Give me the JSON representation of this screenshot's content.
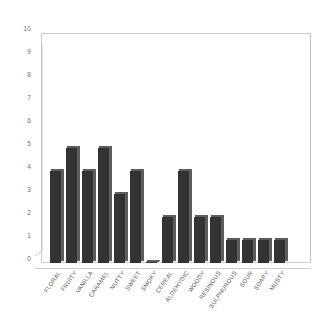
{
  "chart_data": {
    "type": "bar",
    "title": "",
    "subtitle": "",
    "xlabel": "",
    "ylabel": "",
    "ylim": [
      0,
      10
    ],
    "ytick_labels": [
      "0",
      "1",
      "2",
      "3",
      "4",
      "5",
      "6",
      "7",
      "8",
      "9",
      "10"
    ],
    "ytick_values": [
      0,
      1,
      2,
      3,
      4,
      5,
      6,
      7,
      8,
      9,
      10
    ],
    "grid": false,
    "legend": null,
    "bar_color": "#333333",
    "bar_side_color": "#5d5d5d",
    "axis_color": "#c9c9c9",
    "background": "#ffffff",
    "categories": [
      "FLORAL",
      "FRUITY",
      "VANILLA",
      "CARAMEL",
      "NUTTY",
      "SWEET",
      "SMOKY",
      "CEREAL",
      "ALDEHYDIC",
      "WOODY",
      "RESINOUS",
      "SULPHUROUS",
      "SOUR",
      "SOAPY",
      "MUSTY"
    ],
    "values": [
      4,
      5,
      4,
      5,
      3,
      4,
      0,
      2,
      4,
      2,
      2,
      1,
      1,
      1,
      1
    ]
  }
}
